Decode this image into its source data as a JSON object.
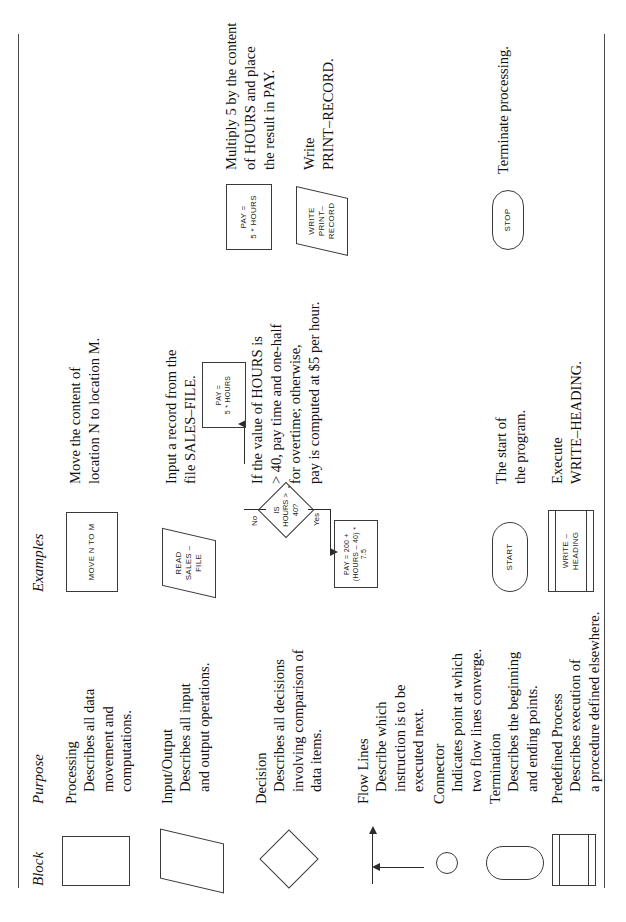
{
  "page": {
    "orientation": "rotated-90-ccw",
    "ink_color": "#2b2b2b"
  },
  "headers": {
    "block": "Block",
    "purpose": "Purpose",
    "examples": "Examples"
  },
  "rows": [
    {
      "id": "processing",
      "shape": "rectangle",
      "term": "Processing",
      "desc": "Describes all data\nmovement and\ncomputations.",
      "example_label": "MOVE N TO M",
      "caption": "Move the content of\nlocation N to location M."
    },
    {
      "id": "input-output",
      "shape": "parallelogram",
      "term": "Input/Output",
      "desc": "Describes all input\nand output operations.",
      "example_label": "READ\nSALES –\nFILE",
      "caption": "Input a record from the\nfile SALES–FILE."
    },
    {
      "id": "decision",
      "shape": "diamond",
      "term": "Decision",
      "desc": "Describes all decisions\ninvolving comparison of\ndata items.",
      "example_label": "",
      "caption": "If the value of HOURS is\n> 40, pay time and one-half\nfor overtime;  otherwise,\npay is computed at $5 per hour."
    },
    {
      "id": "flow-lines",
      "shape": "arrows",
      "term": "Flow Lines",
      "desc": "Describe which\ninstruction is to be\nexecuted next.",
      "example_label": "",
      "caption": ""
    },
    {
      "id": "connector",
      "shape": "circle",
      "term": "Connector",
      "desc": "Indicates point at which\ntwo flow lines converge.",
      "example_label": "",
      "caption": ""
    },
    {
      "id": "termination",
      "shape": "stadium",
      "term": "Termination",
      "desc": "Describes the beginning\nand ending points.",
      "example_label": "START",
      "caption": "The start of\nthe program.",
      "example_label2": "STOP",
      "caption2": "Terminate processing."
    },
    {
      "id": "predefined-process",
      "shape": "predefined",
      "term": "Predefined Process",
      "desc": "Describes execution of\na procedure defined elsewhere.",
      "example_label": "WRITE –\nHEADING",
      "caption": "Execute\nWRITE–HEADING."
    }
  ],
  "decision_flowchart": {
    "decision_label": "IS\nHOURS >\n40?",
    "yes_tag": "Yes",
    "no_tag": "No",
    "yes_box": "PAY = 200 +\n(HOURS – 40) * 7.5",
    "no_box": "PAY =\n5 * HOURS",
    "connector_label": ""
  },
  "extra_examples": {
    "pay_box": "PAY =\n5 * HOURS",
    "pay_caption": "Multiply 5 by the content\nof HOURS and place\nthe result in PAY.",
    "write_box": "WRITE\nPRINT–\nRECORD",
    "write_caption": "Write\nPRINT–RECORD."
  }
}
